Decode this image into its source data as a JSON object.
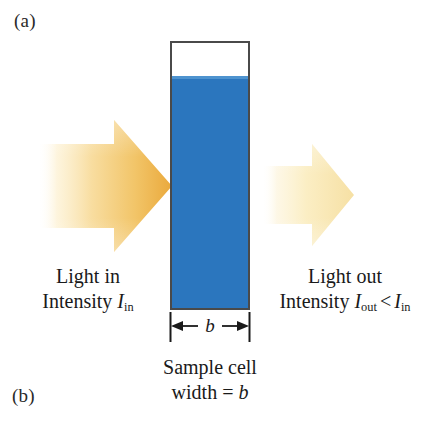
{
  "figure": {
    "panel_a_label": "(a)",
    "panel_b_label": "(b)",
    "background_color": "#ffffff"
  },
  "sample_cell": {
    "liquid_color": "#2b76be",
    "meniscus_color": "#4e93cf",
    "border_color": "#4a4a4a",
    "headspace_color": "#ffffff"
  },
  "dimension": {
    "label": "b",
    "line_color": "#1a1a1a"
  },
  "light_in": {
    "arrow_name": "incident-light-arrow",
    "arrow_color_bright": "#f0b44a",
    "arrow_color_faded": "#fdf2d6",
    "line1": "Light in",
    "intensity_word": "Intensity",
    "symbol": "I",
    "subscript": "in"
  },
  "light_out": {
    "arrow_name": "transmitted-light-arrow",
    "arrow_color_bright": "#f7dfa4",
    "arrow_color_faded": "#fdf5e0",
    "line1": "Light out",
    "intensity_word": "Intensity",
    "symbol_out": "I",
    "subscript_out": "out",
    "relation": "<",
    "symbol_in": "I",
    "subscript_in": "in"
  },
  "cell_caption": {
    "line1": "Sample cell",
    "line2_prefix": "width =",
    "line2_symbol": "b"
  }
}
